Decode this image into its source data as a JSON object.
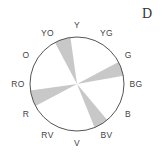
{
  "panel_label": "D",
  "wheel": {
    "center": [
      77,
      84
    ],
    "radius": 47,
    "stroke_color": "#555555",
    "wedge_color": "#c8c8c8",
    "labels": [
      {
        "text": "Y",
        "angle": 0
      },
      {
        "text": "YG",
        "angle": 30
      },
      {
        "text": "G",
        "angle": 60
      },
      {
        "text": "BG",
        "angle": 90
      },
      {
        "text": "B",
        "angle": 120
      },
      {
        "text": "BV",
        "angle": 150
      },
      {
        "text": "V",
        "angle": 180
      },
      {
        "text": "RV",
        "angle": 210
      },
      {
        "text": "R",
        "angle": 240
      },
      {
        "text": "RO",
        "angle": 270
      },
      {
        "text": "O",
        "angle": 300
      },
      {
        "text": "YO",
        "angle": 330
      }
    ],
    "shaded_wedges": [
      {
        "start": 332,
        "end": 352
      },
      {
        "start": 62,
        "end": 80
      },
      {
        "start": 140,
        "end": 158
      },
      {
        "start": 242,
        "end": 262
      }
    ]
  }
}
